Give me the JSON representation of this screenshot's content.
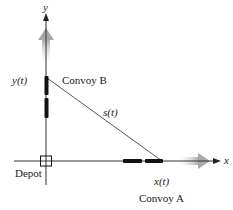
{
  "axes": {
    "x_label": "x",
    "y_label": "y"
  },
  "labels": {
    "convoy_a": "Convoy A",
    "convoy_b": "Convoy B",
    "x_of_t": "x(t)",
    "y_of_t": "y(t)",
    "s_of_t": "s(t)",
    "depot": "Depot"
  },
  "colors": {
    "axis": "#333333",
    "convoy": "#111111",
    "motion_arrow": "#a8a8a8",
    "distance_line": "#555555"
  }
}
